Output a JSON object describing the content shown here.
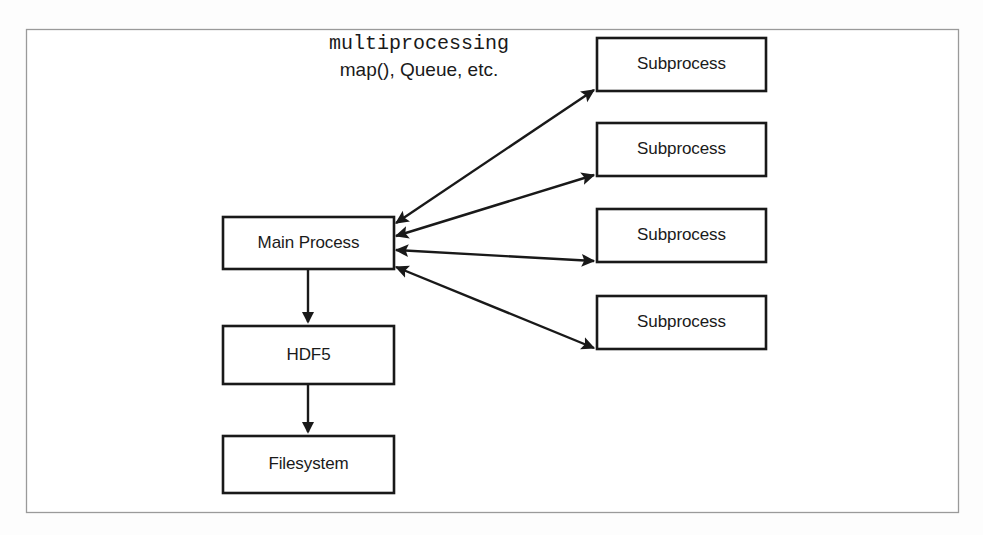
{
  "figure": {
    "background_color": "#ffffff",
    "frame_color": "#9a9a9a",
    "line_color": "#191919",
    "text_color": "#1a1a1a"
  },
  "annotation": {
    "line1": "multiprocessing",
    "line1_style": "monospace",
    "line2": "map(), Queue, etc.",
    "line2_style": "sans-serif"
  },
  "nodes": {
    "main_process": {
      "label": "Main Process"
    },
    "hdf5": {
      "label": "HDF5"
    },
    "filesystem": {
      "label": "Filesystem"
    },
    "subprocesses": [
      {
        "label": "Subprocess"
      },
      {
        "label": "Subprocess"
      },
      {
        "label": "Subprocess"
      },
      {
        "label": "Subprocess"
      }
    ]
  },
  "edges": [
    {
      "from": "Main Process",
      "to": "Subprocess 1",
      "arrow": "double"
    },
    {
      "from": "Main Process",
      "to": "Subprocess 2",
      "arrow": "double"
    },
    {
      "from": "Main Process",
      "to": "Subprocess 3",
      "arrow": "double"
    },
    {
      "from": "Main Process",
      "to": "Subprocess 4",
      "arrow": "double"
    },
    {
      "from": "Main Process",
      "to": "HDF5",
      "arrow": "single"
    },
    {
      "from": "HDF5",
      "to": "Filesystem",
      "arrow": "single"
    }
  ]
}
